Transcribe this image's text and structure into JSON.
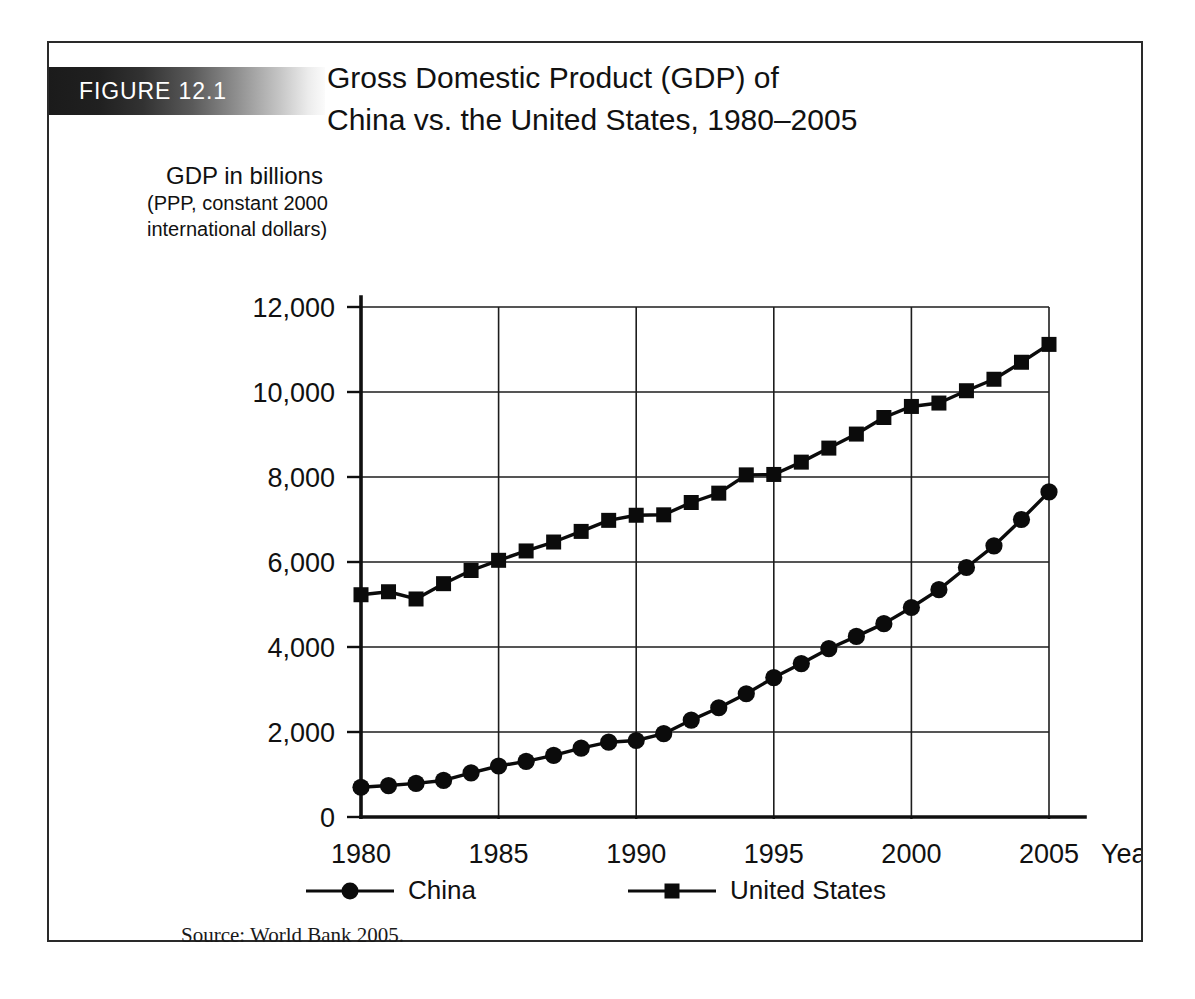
{
  "figure": {
    "banner_label": "FIGURE 12.1",
    "title_line_1": "Gross Domestic Product (GDP) of",
    "title_line_2": "China vs. the United States, 1980–2005",
    "source_note": "Source: World Bank 2005.",
    "frame_color": "#2a2a2a",
    "banner_gradient_from": "#1b1b1b",
    "banner_gradient_to": "#fbfbfb",
    "ink_color": "#0b0b0b",
    "background_color": "#ffffff"
  },
  "y_caption": {
    "main": "GDP in billions",
    "sub_line_1": "(PPP, constant 2000",
    "sub_line_2": "international dollars)"
  },
  "legend": {
    "items": [
      {
        "label": "China",
        "marker": "circle"
      },
      {
        "label": "United States",
        "marker": "square"
      }
    ]
  },
  "chart_data": {
    "type": "line",
    "title": "Gross Domestic Product (GDP) of China vs. the United States, 1980–2005",
    "xlabel": "Year",
    "ylabel": "GDP in billions (PPP, constant 2000 international dollars)",
    "xlim": [
      1980,
      2005
    ],
    "ylim": [
      0,
      12000
    ],
    "xticks": [
      1980,
      1985,
      1990,
      1995,
      2000,
      2005
    ],
    "xtick_labels": [
      "1980",
      "1985",
      "1990",
      "1995",
      "2000",
      "2005"
    ],
    "yticks": [
      0,
      2000,
      4000,
      6000,
      8000,
      10000,
      12000
    ],
    "ytick_labels": [
      "0",
      "2,000",
      "4,000",
      "6,000",
      "8,000",
      "10,000",
      "12,000"
    ],
    "grid": true,
    "grid_axis": "both",
    "legend_position": "bottom",
    "x": [
      1980,
      1981,
      1982,
      1983,
      1984,
      1985,
      1986,
      1987,
      1988,
      1989,
      1990,
      1991,
      1992,
      1993,
      1994,
      1995,
      1996,
      1997,
      1998,
      1999,
      2000,
      2001,
      2002,
      2003,
      2004,
      2005
    ],
    "series": [
      {
        "name": "China",
        "marker": "circle",
        "values": [
          700,
          740,
          790,
          860,
          1040,
          1200,
          1310,
          1450,
          1620,
          1760,
          1800,
          1960,
          2280,
          2570,
          2900,
          3280,
          3610,
          3960,
          4250,
          4550,
          4930,
          5350,
          5870,
          6380,
          7000,
          7650
        ]
      },
      {
        "name": "United States",
        "marker": "square",
        "values": [
          5230,
          5300,
          5130,
          5490,
          5800,
          6040,
          6260,
          6470,
          6720,
          6980,
          7100,
          7110,
          7400,
          7620,
          8050,
          8060,
          8350,
          8680,
          9010,
          9400,
          9660,
          9740,
          10030,
          10300,
          10700,
          11120
        ]
      }
    ]
  },
  "axis_labels": {
    "year_label": "Year"
  }
}
